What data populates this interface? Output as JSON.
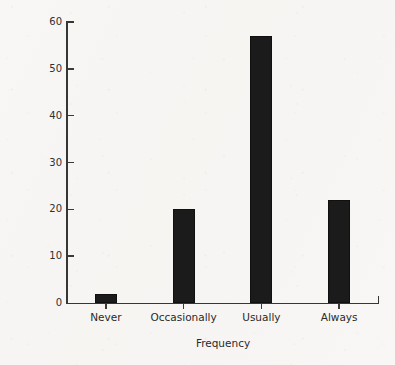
{
  "chart_data": {
    "type": "bar",
    "title": "",
    "subtitle": "",
    "xlabel": "Frequency",
    "ylabel": "Percentage of Police Services",
    "categories": [
      "Never",
      "Occasionally",
      "Usually",
      "Always"
    ],
    "values": [
      2,
      20,
      57,
      22
    ],
    "series": [
      {
        "name": "Percentage of Police Services",
        "values": [
          2,
          20,
          57,
          22
        ]
      }
    ],
    "ylim": [
      0,
      60
    ],
    "y_ticks": [
      0,
      10,
      20,
      30,
      40,
      50,
      60
    ],
    "y_tick_labels": [
      "0",
      "10",
      "20",
      "30",
      "40",
      "50",
      "60"
    ],
    "grid": false,
    "legend": false,
    "legend_position": "none",
    "bar_color": "#1b1b1b",
    "axis_color": "#363636",
    "background_color": "#f8f7f5",
    "annotations": []
  }
}
